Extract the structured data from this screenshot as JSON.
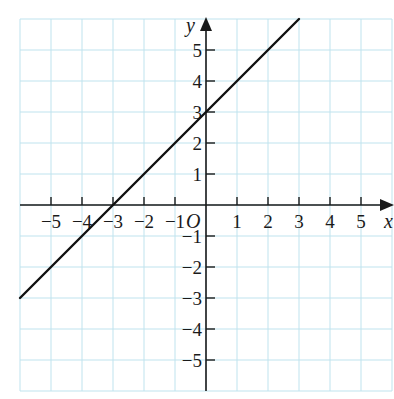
{
  "chart_data": {
    "type": "line",
    "title": "",
    "xlabel": "x",
    "ylabel": "y",
    "origin_label": "O",
    "xlim": [
      -6,
      6
    ],
    "ylim": [
      -6,
      6
    ],
    "grid": true,
    "x_ticks": [
      -5,
      -4,
      -3,
      -2,
      -1,
      1,
      2,
      3,
      4,
      5
    ],
    "y_ticks": [
      5,
      4,
      3,
      2,
      1,
      -1,
      -2,
      -3,
      -4,
      -5
    ],
    "series": [
      {
        "name": "y = x + 3",
        "slope": 1,
        "intercept": 3,
        "x": [
          -6,
          3
        ],
        "y": [
          -3,
          6
        ]
      }
    ],
    "colors": {
      "grid": "#bfe3ee",
      "axis": "#1a1a1a",
      "line": "#111111"
    }
  }
}
